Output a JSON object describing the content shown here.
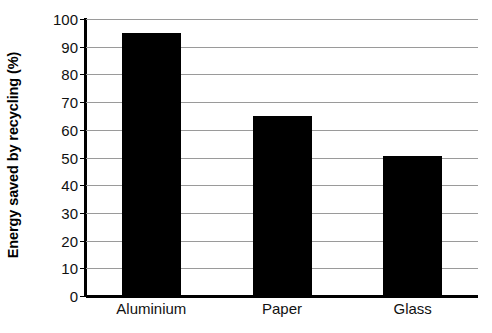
{
  "chart_data": {
    "type": "bar",
    "title": "",
    "subtitle": "",
    "xlabel": "",
    "ylabel": "Energy saved by recycling (%)",
    "categories": [
      "Aluminium",
      "Paper",
      "Glass"
    ],
    "values": [
      95,
      65,
      50.5
    ],
    "ylim": [
      0,
      100
    ],
    "ytick_values": [
      0,
      10,
      20,
      30,
      40,
      50,
      60,
      70,
      80,
      90,
      100
    ],
    "ytick_labels": [
      "0",
      "10",
      "20",
      "30",
      "40",
      "50",
      "60",
      "70",
      "80",
      "90",
      "100"
    ],
    "grid": true,
    "grid_axis": "y",
    "legend": false,
    "legend_position": "none",
    "bar_color": "#000000",
    "gridline_color": "#9a9a9a",
    "axis_color": "#000000",
    "background_color": "#ffffff",
    "series": [
      {
        "name": "Energy saved by recycling (%)",
        "values": [
          95,
          65,
          50.5
        ]
      }
    ]
  }
}
